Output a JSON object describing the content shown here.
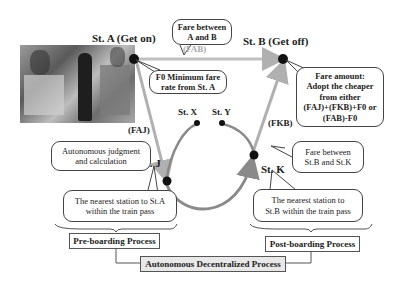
{
  "stations": {
    "a": "St. A (Get on)",
    "b": "St. B (Get off)",
    "x": "St. X",
    "y": "St. Y",
    "j": "St. J",
    "k": "St. K"
  },
  "fare_labels": {
    "fab": "(FAB)",
    "faj": "(FAJ)",
    "fkb": "(FKB)"
  },
  "callouts": {
    "fare_ab": [
      "Fare between",
      "A and B"
    ],
    "f0": [
      "F0 Minimum fare",
      "rate from St. A"
    ],
    "fare_amount": [
      "Fare amount:",
      "Adopt the cheaper",
      "from either",
      "(FAJ)+(FKB)+F0 or",
      "(FAB)-F0"
    ],
    "autonomous_judgment": [
      "Autonomous judgment",
      "and calculation"
    ],
    "fare_bk": [
      "Fare between",
      "St.B and St.K"
    ],
    "nearest_a": [
      "The nearest station to St.A",
      "within the train pass"
    ],
    "nearest_b": [
      "The nearest station to",
      "St.B within the train pass"
    ]
  },
  "process_boxes": {
    "pre": "Pre-boarding Process",
    "post": "Post-boarding Process",
    "central": "Autonomous Decentralized Process"
  },
  "colors": {
    "line_gray": "#b0b0b0",
    "curve_gray": "#8a8a8a",
    "node": "#111111",
    "central_box_bg": "#e8e8e8"
  }
}
